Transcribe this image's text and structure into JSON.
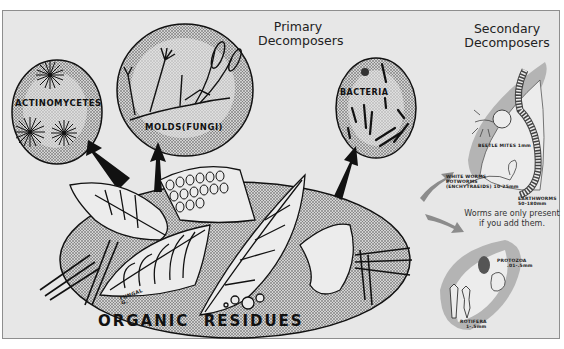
{
  "diagram": {
    "headings": {
      "primary": [
        "Primary",
        "Decomposers"
      ],
      "secondary": [
        "Secondary",
        "Decomposers"
      ]
    },
    "organisms": {
      "actinomycetes": "ACTINOMYCETES",
      "molds": "MOLDS(FUNGI)",
      "bacteria": "BACTERIA",
      "beetle_mites": "BEETLE MITES 1mm",
      "white_worms": [
        "WHITE WORMS",
        "POTWORMS",
        "(ENCHYTRAEIDS) 10-25mm"
      ],
      "earthworms": [
        "EARTHWORMS",
        "50-180mm"
      ],
      "protozoa": [
        "PROTOZOA",
        ".01-.5mm"
      ],
      "rotifera": [
        "ROTIFERA",
        "1-.5mm"
      ],
      "fungal": [
        "FUNGAL",
        "G."
      ]
    },
    "base_label": "ORGANIC  RESIDUES",
    "note": [
      "Worms are only present",
      "if you add them."
    ],
    "colors": {
      "background": "#e7e7e7",
      "ink": "#111111",
      "stipple": "#9a9a9a",
      "secondary_gray": "#8c8c8c"
    }
  }
}
